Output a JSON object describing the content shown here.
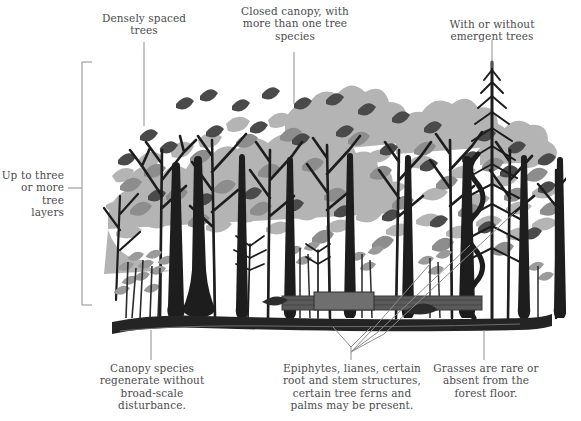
{
  "figure": {
    "title_alt": "Rainforest structure cross-section diagram",
    "background_color": "#ffffff",
    "text_color": "#4c4c4c",
    "leader_line_color": "#8d8d8d",
    "palette": {
      "leaf_light": "#b4b4b4",
      "leaf_mid": "#8d8d8d",
      "leaf_dark": "#4f4f4f",
      "trunk_black": "#1d1d1d",
      "ground_dark": "#2b2b2b",
      "litter_mid": "#6d6d6d"
    }
  },
  "labels": {
    "densely_spaced_trees": "Densely spaced\ntrees",
    "closed_canopy": "Closed canopy, with\nmore than one tree\nspecies",
    "emergent_trees": "With or without\nemergent trees",
    "tree_layers": "Up to three\nor more tree\nlayers",
    "canopy_regeneration": "Canopy species\nregenerate without\nbroad-scale\ndisturbance.",
    "epiphytes": "Epiphytes, lianes, certain\nroot and stem structures,\ncertain tree ferns and\npalms may be present.",
    "grasses": "Grasses are rare or\nabsent from the\nforest floor."
  },
  "annotations": [
    {
      "name": "densely-spaced-trees",
      "anchor": "canopy-mid-left",
      "leader": "vertical"
    },
    {
      "name": "closed-canopy",
      "anchor": "canopy-centre",
      "leader": "vertical"
    },
    {
      "name": "emergent-trees",
      "anchor": "emergent-conifer-crown",
      "leader": "vertical"
    },
    {
      "name": "tree-layers",
      "anchor": "left-bracket",
      "leader": "bracket"
    },
    {
      "name": "canopy-regeneration",
      "anchor": "forest-floor-left",
      "leader": "vertical"
    },
    {
      "name": "epiphytes-lianes",
      "anchor": "multiple-stems",
      "leader": "fan"
    },
    {
      "name": "grasses",
      "anchor": "forest-floor-right",
      "leader": "vertical"
    }
  ]
}
